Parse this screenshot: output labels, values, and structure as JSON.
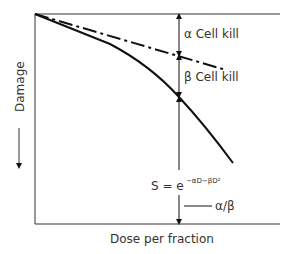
{
  "diagram": {
    "title": "",
    "y_axis_label": "Damage",
    "x_axis_label": "Dose per fraction",
    "annotations": {
      "alpha_kill": "α Cell kill",
      "beta_kill": "β Cell kill",
      "formula_base": "S = e",
      "formula_exponent": "−αD−βD²",
      "ratio": "α/β"
    },
    "curves": [
      {
        "name": "linear-alpha-component",
        "style": "dash-dot"
      },
      {
        "name": "linear-quadratic-survival",
        "style": "solid"
      }
    ],
    "colors": {
      "line": "#111111",
      "text": "#333333",
      "background": "#ffffff"
    }
  }
}
